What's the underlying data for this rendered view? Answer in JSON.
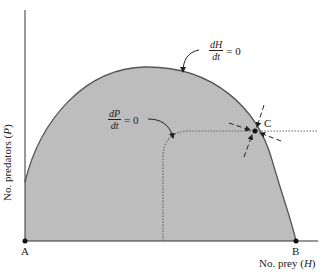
{
  "figure": {
    "type": "predator-prey isocline phase diagram",
    "y_axis_label": "No. predators (P)",
    "y_axis_label_parts": {
      "text": "No. predators (",
      "var": "P",
      "close": ")"
    },
    "x_axis_label_parts": {
      "text": "No. prey (",
      "var": "H",
      "close": ")"
    },
    "points": {
      "A": {
        "label": "A",
        "description": "origin equilibrium"
      },
      "B": {
        "label": "B",
        "description": "prey-only equilibrium (carrying capacity)"
      },
      "C": {
        "label": "C",
        "description": "joint equilibrium where isoclines intersect"
      }
    },
    "isoclines": {
      "prey": {
        "numerator": "dH",
        "denominator": "dt",
        "equals": "= 0",
        "style": "solid hump-shaped curve"
      },
      "predator": {
        "numerator": "dP",
        "denominator": "dt",
        "equals": "= 0",
        "style": "dotted L-shaped curve"
      }
    },
    "colors": {
      "shaded_region": "#bdbdbd",
      "curve": "#555555",
      "axis": "#333333",
      "point": "#111111",
      "background": "#ffffff"
    }
  }
}
